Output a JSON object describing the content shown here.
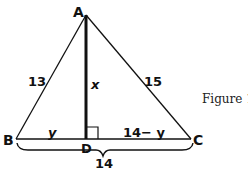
{
  "figure": {
    "caption": "Figure 1",
    "vertices": {
      "A": "A",
      "B": "B",
      "C": "C",
      "D": "D"
    },
    "sides": {
      "AB": "13",
      "AC": "15",
      "AD": "x",
      "BD": "y",
      "DC": "14− y",
      "BC": "14"
    },
    "colors": {
      "line": "#111111",
      "background": "#ffffff"
    }
  }
}
